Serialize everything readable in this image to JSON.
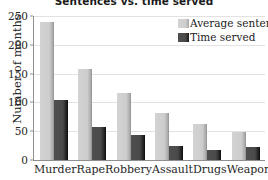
{
  "chart_data": {
    "type": "bar",
    "title": "Sentences vs. time served",
    "xlabel": "",
    "ylabel": "Number of months",
    "categories": [
      "Murder",
      "Rape",
      "Robbery",
      "Assault",
      "Drugs",
      "Weapons"
    ],
    "series": [
      {
        "name": "Average sentence",
        "color": "#cdcdcd",
        "values": [
          240,
          158,
          117,
          82,
          63,
          49
        ]
      },
      {
        "name": "Time served",
        "color": "#4a4a4a",
        "values": [
          104,
          58,
          44,
          25,
          18,
          22
        ]
      }
    ],
    "ylim": [
      0,
      250
    ],
    "yticks": [
      0,
      50,
      100,
      150,
      200,
      250
    ],
    "grid": true,
    "legend_position": "top-right"
  },
  "legend": {
    "items": [
      {
        "label": "Average sentence",
        "swatch": "light"
      },
      {
        "label": "Time served",
        "swatch": "dark"
      }
    ]
  }
}
